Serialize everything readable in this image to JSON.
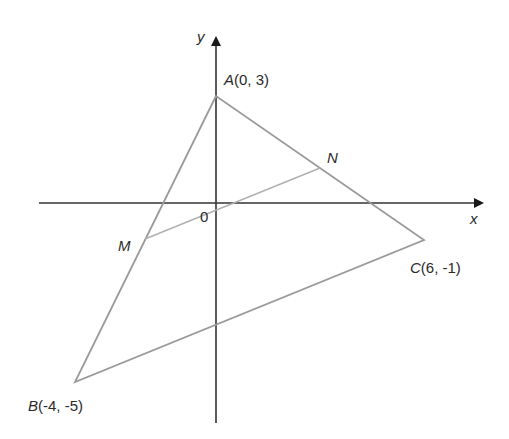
{
  "diagram": {
    "axes": {
      "x_label": "x",
      "y_label": "y",
      "origin_label": "0"
    },
    "points": {
      "A": {
        "name": "A",
        "coords": "(0, 3)"
      },
      "B": {
        "name": "B",
        "coords": "(-4, -5)"
      },
      "C": {
        "name": "C",
        "coords": "(6, -1)"
      },
      "M": {
        "name": "M"
      },
      "N": {
        "name": "N"
      }
    },
    "colors": {
      "axis": "#1a1a1a",
      "triangle": "#9a9a9a",
      "midsegment": "#b0b0b0",
      "text": "#2a2a2a"
    }
  }
}
